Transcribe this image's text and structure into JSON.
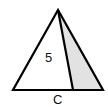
{
  "diagram": {
    "labels": {
      "area": "5",
      "base": "C"
    },
    "colors": {
      "stroke": "#000000",
      "shaded": "#e2e2e2",
      "background": "#ffffff"
    }
  }
}
